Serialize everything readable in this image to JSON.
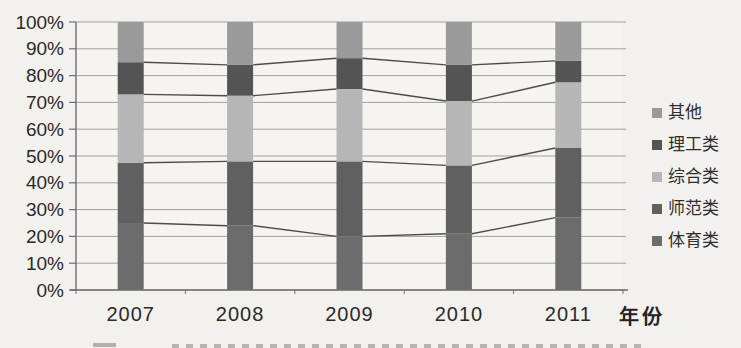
{
  "figure": {
    "background": "#f3f1ee",
    "plot_background": "#f6f4f1",
    "grid_color": "#a0a0a0",
    "axis_color": "#6f6f6f",
    "connector_line_color": "#4c4c4c",
    "text_color": "#2a2a2a"
  },
  "chart_data": {
    "type": "bar",
    "subtype": "100-percent-stacked-column-with-series-lines",
    "title": "",
    "xlabel": "年份",
    "ylabel": "",
    "categories": [
      "2007",
      "2008",
      "2009",
      "2010",
      "2011"
    ],
    "series": [
      {
        "name": "体育类",
        "color": "#6c6c6c",
        "values": [
          25,
          24,
          20,
          21,
          27
        ]
      },
      {
        "name": "师范类",
        "color": "#606060",
        "values": [
          22.5,
          24,
          28,
          25.5,
          26
        ]
      },
      {
        "name": "综合类",
        "color": "#b6b6b6",
        "values": [
          25.5,
          24.5,
          27,
          24,
          24.5
        ]
      },
      {
        "name": "理工类",
        "color": "#545454",
        "values": [
          12,
          11.5,
          11.5,
          13.5,
          8
        ]
      },
      {
        "name": "其他",
        "color": "#9a9a9a",
        "values": [
          15,
          16,
          13.5,
          16,
          14.5
        ]
      }
    ],
    "stack_order": "bottom-to-top",
    "legend_position": "right",
    "legend_order_top_to_bottom": [
      "其他",
      "理工类",
      "综合类",
      "师范类",
      "体育类"
    ],
    "ylim": [
      0,
      100
    ],
    "yticks": [
      0,
      10,
      20,
      30,
      40,
      50,
      60,
      70,
      80,
      90,
      100
    ],
    "ytick_labels": [
      "0%",
      "10%",
      "20%",
      "30%",
      "40%",
      "50%",
      "60%",
      "70%",
      "80%",
      "90%",
      "100%"
    ],
    "grid": true,
    "series_lines": true
  }
}
